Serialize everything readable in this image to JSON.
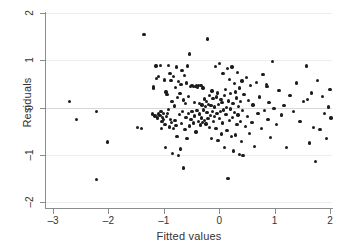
{
  "chart_data": {
    "type": "scatter",
    "title": "",
    "xlabel": "Fitted values",
    "ylabel": "Residuals",
    "xlim": [
      -3.2,
      2.15
    ],
    "ylim": [
      -2.15,
      2.15
    ],
    "xticks": [
      -3,
      -2,
      -1,
      0,
      1,
      2
    ],
    "xticklabels": [
      "–3",
      "–2",
      "–1",
      "0",
      "1",
      "2"
    ],
    "yticks": [
      -2,
      -1,
      0,
      1,
      2
    ],
    "yticklabels": [
      "–2",
      "–1",
      "0",
      "1",
      "2"
    ],
    "grid": true,
    "grid_axis": "y",
    "marker_color": "#1c1c1c",
    "marker_size": 3.3,
    "n_points": 206,
    "points": [
      [
        -2.7,
        0.12
      ],
      [
        -2.58,
        -0.26
      ],
      [
        -2.22,
        -0.09
      ],
      [
        -2.21,
        -1.53
      ],
      [
        -2.02,
        -0.73
      ],
      [
        -1.48,
        -0.43
      ],
      [
        -1.4,
        -0.44
      ],
      [
        -1.36,
        1.55
      ],
      [
        -1.21,
        -0.14
      ],
      [
        -1.19,
        0.45
      ],
      [
        -1.18,
        0.41
      ],
      [
        -1.16,
        -0.18
      ],
      [
        -1.14,
        0.88
      ],
      [
        -1.13,
        0.62
      ],
      [
        -1.12,
        -0.22
      ],
      [
        -1.1,
        0.65
      ],
      [
        -1.09,
        -0.14
      ],
      [
        -1.07,
        -0.17
      ],
      [
        -1.06,
        0.89
      ],
      [
        -1.05,
        -0.09
      ],
      [
        -1.04,
        -0.45
      ],
      [
        -1.03,
        -0.3
      ],
      [
        -1.02,
        -0.21
      ],
      [
        -1.01,
        -0.12
      ],
      [
        -1.0,
        -0.26
      ],
      [
        -0.99,
        0.58
      ],
      [
        -0.98,
        -0.36
      ],
      [
        -0.97,
        -0.85
      ],
      [
        -0.96,
        0.33
      ],
      [
        -0.95,
        -0.19
      ],
      [
        -0.94,
        0.27
      ],
      [
        -0.93,
        -0.12
      ],
      [
        -0.92,
        -0.04
      ],
      [
        -0.91,
        0.89
      ],
      [
        -0.9,
        -0.41
      ],
      [
        -0.89,
        0.72
      ],
      [
        -0.88,
        -0.25
      ],
      [
        -0.87,
        0.57
      ],
      [
        -0.86,
        -0.32
      ],
      [
        -0.85,
        0.12
      ],
      [
        -0.84,
        -0.97
      ],
      [
        -0.83,
        0.65
      ],
      [
        -0.82,
        -0.44
      ],
      [
        -0.81,
        0.03
      ],
      [
        -0.8,
        -0.28
      ],
      [
        -0.79,
        0.42
      ],
      [
        -0.78,
        -0.38
      ],
      [
        -0.77,
        0.86
      ],
      [
        -0.76,
        -0.62
      ],
      [
        -0.75,
        0.21
      ],
      [
        -0.74,
        -1.02
      ],
      [
        -0.73,
        0.55
      ],
      [
        -0.72,
        -0.15
      ],
      [
        -0.71,
        0.3
      ],
      [
        -0.7,
        -0.88
      ],
      [
        -0.69,
        0.48
      ],
      [
        -0.68,
        -0.34
      ],
      [
        -0.67,
        0.78
      ],
      [
        -0.66,
        -0.09
      ],
      [
        -0.65,
        0.16
      ],
      [
        -0.64,
        -1.28
      ],
      [
        -0.63,
        0.67
      ],
      [
        -0.62,
        -0.47
      ],
      [
        -0.61,
        0.09
      ],
      [
        -0.6,
        -0.21
      ],
      [
        -0.59,
        0.52
      ],
      [
        -0.58,
        -0.66
      ],
      [
        -0.57,
        0.88
      ],
      [
        -0.56,
        -0.13
      ],
      [
        -0.55,
        0.24
      ],
      [
        -0.54,
        1.13
      ],
      [
        -0.53,
        -0.39
      ],
      [
        -0.52,
        0.44
      ],
      [
        -0.51,
        -0.26
      ],
      [
        -0.5,
        0.47
      ],
      [
        -0.49,
        -0.08
      ],
      [
        -0.48,
        0.46
      ],
      [
        -0.47,
        -0.33
      ],
      [
        -0.46,
        0.45
      ],
      [
        -0.45,
        0.11
      ],
      [
        -0.44,
        -0.18
      ],
      [
        -0.43,
        0.44
      ],
      [
        -0.42,
        -0.52
      ],
      [
        -0.41,
        0.46
      ],
      [
        -0.4,
        -0.06
      ],
      [
        -0.39,
        0.43
      ],
      [
        -0.38,
        -0.29
      ],
      [
        -0.37,
        0.47
      ],
      [
        -0.36,
        -0.14
      ],
      [
        -0.35,
        0.08
      ],
      [
        -0.34,
        -0.37
      ],
      [
        -0.33,
        0.46
      ],
      [
        -0.32,
        -0.22
      ],
      [
        -0.31,
        0.05
      ],
      [
        -0.3,
        -0.31
      ],
      [
        -0.29,
        0.41
      ],
      [
        -0.28,
        -0.05
      ],
      [
        -0.27,
        0.18
      ],
      [
        -0.26,
        -0.27
      ],
      [
        -0.25,
        0.02
      ],
      [
        -0.24,
        -0.35
      ],
      [
        -0.23,
        0.13
      ],
      [
        -0.22,
        -0.1
      ],
      [
        -0.21,
        1.45
      ],
      [
        -0.2,
        -0.23
      ],
      [
        -0.19,
        0.07
      ],
      [
        -0.18,
        -0.42
      ],
      [
        -0.17,
        0.26
      ],
      [
        -0.16,
        -0.17
      ],
      [
        -0.15,
        0.04
      ],
      [
        -0.14,
        -0.66
      ],
      [
        -0.13,
        0.35
      ],
      [
        -0.12,
        -0.08
      ],
      [
        -0.11,
        0.19
      ],
      [
        -0.1,
        -0.3
      ],
      [
        -0.09,
        0.01
      ],
      [
        -0.08,
        -0.19
      ],
      [
        -0.07,
        0.87
      ],
      [
        -0.06,
        -0.45
      ],
      [
        -0.05,
        0.22
      ],
      [
        -0.04,
        -0.12
      ],
      [
        -0.03,
        0.31
      ],
      [
        -0.02,
        -0.7
      ],
      [
        -0.01,
        0.06
      ],
      [
        0.0,
        -0.24
      ],
      [
        0.01,
        0.93
      ],
      [
        0.02,
        -0.08
      ],
      [
        0.03,
        0.17
      ],
      [
        0.04,
        -0.56
      ],
      [
        0.05,
        0.11
      ],
      [
        0.06,
        -0.33
      ],
      [
        0.07,
        0.72
      ],
      [
        0.08,
        -0.05
      ],
      [
        0.09,
        0.25
      ],
      [
        0.1,
        -0.84
      ],
      [
        0.11,
        0.38
      ],
      [
        0.12,
        -0.15
      ],
      [
        0.13,
        0.0
      ],
      [
        0.14,
        -0.49
      ],
      [
        0.15,
        0.83
      ],
      [
        0.16,
        -1.5
      ],
      [
        0.17,
        0.14
      ],
      [
        0.18,
        -0.27
      ],
      [
        0.19,
        0.6
      ],
      [
        0.2,
        -0.03
      ],
      [
        0.21,
        0.29
      ],
      [
        0.22,
        -0.61
      ],
      [
        0.23,
        0.86
      ],
      [
        0.24,
        -0.21
      ],
      [
        0.25,
        0.09
      ],
      [
        0.26,
        -0.92
      ],
      [
        0.27,
        0.51
      ],
      [
        0.28,
        -0.11
      ],
      [
        0.29,
        0.33
      ],
      [
        0.3,
        -0.58
      ],
      [
        0.31,
        0.2
      ],
      [
        0.32,
        -0.36
      ],
      [
        0.33,
        0.74
      ],
      [
        0.34,
        -0.16
      ],
      [
        0.35,
        0.02
      ],
      [
        0.36,
        -0.99
      ],
      [
        0.37,
        0.41
      ],
      [
        0.38,
        -0.29
      ],
      [
        0.39,
        0.12
      ],
      [
        0.4,
        -0.72
      ],
      [
        0.41,
        0.56
      ],
      [
        0.42,
        -0.07
      ],
      [
        0.43,
        -1.01
      ],
      [
        0.45,
        0.28
      ],
      [
        0.47,
        -0.4
      ],
      [
        0.49,
        0.64
      ],
      [
        0.51,
        -0.19
      ],
      [
        0.53,
        0.15
      ],
      [
        0.55,
        -0.55
      ],
      [
        0.57,
        0.47
      ],
      [
        0.59,
        -0.31
      ],
      [
        0.61,
        0.05
      ],
      [
        0.64,
        -0.83
      ],
      [
        0.67,
        0.53
      ],
      [
        0.7,
        -0.13
      ],
      [
        0.73,
        0.22
      ],
      [
        0.76,
        -0.44
      ],
      [
        0.79,
        0.7
      ],
      [
        0.82,
        -0.06
      ],
      [
        0.85,
        0.48
      ],
      [
        0.86,
        0.45
      ],
      [
        0.88,
        -0.25
      ],
      [
        0.9,
        0.1
      ],
      [
        0.93,
        -0.63
      ],
      [
        0.96,
        0.97
      ],
      [
        0.99,
        -0.02
      ],
      [
        1.04,
        -0.36
      ],
      [
        1.08,
        0.36
      ],
      [
        1.12,
        -0.16
      ],
      [
        1.17,
        0.04
      ],
      [
        1.22,
        -0.85
      ],
      [
        1.28,
        0.25
      ],
      [
        1.34,
        -0.09
      ],
      [
        1.4,
        0.52
      ],
      [
        1.46,
        -0.29
      ],
      [
        1.52,
        0.13
      ],
      [
        1.58,
        0.88
      ],
      [
        1.6,
        0.17
      ],
      [
        1.63,
        -0.75
      ],
      [
        1.66,
        0.31
      ],
      [
        1.7,
        -0.43
      ],
      [
        1.74,
        -1.14
      ],
      [
        1.78,
        0.57
      ],
      [
        1.82,
        -0.47
      ],
      [
        1.86,
        0.24
      ],
      [
        1.9,
        -0.12
      ],
      [
        1.94,
        -0.66
      ],
      [
        1.97,
        0.01
      ],
      [
        2.0,
        0.38
      ],
      [
        2.02,
        -0.22
      ]
    ]
  }
}
